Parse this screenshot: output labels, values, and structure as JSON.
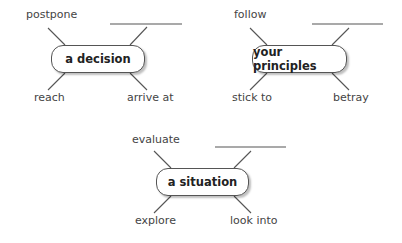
{
  "maps": [
    {
      "center": "a decision",
      "top_left": "postpone",
      "top_right": "",
      "bottom_left": "reach",
      "bottom_right": "arrive at"
    },
    {
      "center": "your principles",
      "top_left": "follow",
      "top_right": "",
      "bottom_left": "stick to",
      "bottom_right": "betray"
    },
    {
      "center": "a situation",
      "top_left": "evaluate",
      "top_right": "",
      "bottom_left": "explore",
      "bottom_right": "look into"
    }
  ]
}
